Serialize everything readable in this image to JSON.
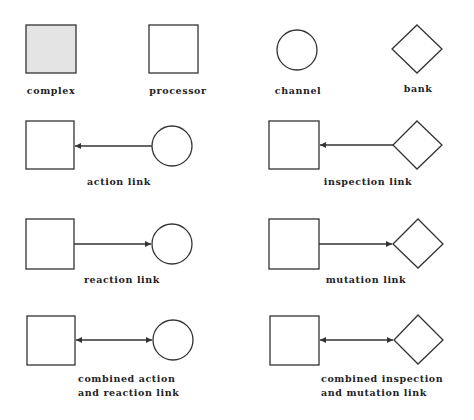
{
  "diagram": {
    "colors": {
      "stroke": "#333333",
      "complex_fill": "#e4e4e4",
      "background": "#ffffff",
      "text": "#222222"
    },
    "legend_shapes": [
      {
        "id": "complex",
        "shape": "square-filled",
        "label": "complex"
      },
      {
        "id": "processor",
        "shape": "square",
        "label": "processor"
      },
      {
        "id": "channel",
        "shape": "circle",
        "label": "channel"
      },
      {
        "id": "bank",
        "shape": "diamond",
        "label": "bank"
      }
    ],
    "links": [
      {
        "id": "action",
        "from": "channel",
        "to": "processor",
        "direction": "left",
        "label": "action link"
      },
      {
        "id": "inspection",
        "from": "bank",
        "to": "processor",
        "direction": "left",
        "label": "inspection link"
      },
      {
        "id": "reaction",
        "from": "processor",
        "to": "channel",
        "direction": "right",
        "label": "reaction link"
      },
      {
        "id": "mutation",
        "from": "processor",
        "to": "bank",
        "direction": "right",
        "label": "mutation link"
      },
      {
        "id": "combined_action_reaction",
        "from": "processor",
        "to": "channel",
        "direction": "both",
        "label_line1": "combined action",
        "label_line2": "and reaction link"
      },
      {
        "id": "combined_inspection_mutation",
        "from": "processor",
        "to": "bank",
        "direction": "both",
        "label_line1": "combined inspection",
        "label_line2": "and mutation link"
      }
    ]
  }
}
